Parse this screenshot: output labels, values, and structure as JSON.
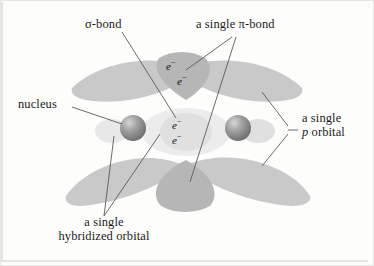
{
  "figure": {
    "background_color": "#fdfdfc",
    "border_color": "#d8d8d6",
    "lobe_color": "#c9c9c9",
    "lobe_overlap_color": "#b4b4b4",
    "pale_lobe_color": "#e2e2e2",
    "nucleus_color": "#8a8a8a",
    "leader_color": "#5a5a5a",
    "text_color": "#1b1b1b"
  },
  "labels": {
    "sigma_bond": "σ-bond",
    "pi_bond": "a single π-bond",
    "nucleus": "nucleus",
    "p_orbital_line1": "a single",
    "p_orbital_line2_italic": "p",
    "p_orbital_line2_rest": " orbital",
    "hybridized_line1": "a single",
    "hybridized_line2": "hybridized orbital"
  },
  "electrons": {
    "symbol": "e",
    "charge": "−",
    "pi_pair": [
      "e−",
      "e−"
    ],
    "sigma_pair": [
      "e−",
      "e−"
    ],
    "pi_count": 2,
    "sigma_count": 2
  },
  "nuclei": {
    "count": 2,
    "left_label": "nucleus",
    "right_label": "nucleus"
  }
}
